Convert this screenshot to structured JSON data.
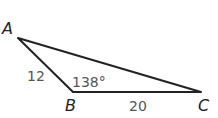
{
  "diagram": {
    "type": "triangle",
    "vertices": [
      {
        "name": "A",
        "x": 18,
        "y": 38
      },
      {
        "name": "B",
        "x": 73,
        "y": 92
      },
      {
        "name": "C",
        "x": 201,
        "y": 92
      }
    ],
    "labels": {
      "A": "A",
      "B": "B",
      "C": "C",
      "side_AB": "12",
      "side_BC": "20",
      "angle_B": "138°"
    },
    "colors": {
      "stroke": "#222222",
      "measure_text": "#555555"
    }
  }
}
